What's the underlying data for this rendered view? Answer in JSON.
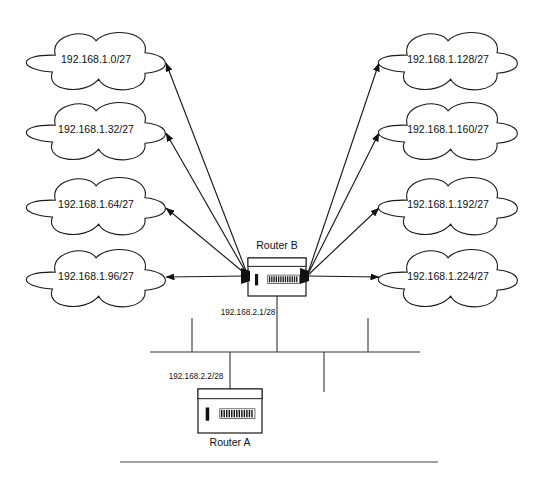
{
  "diagram": {
    "colors": {
      "stroke": "#1a1a1a",
      "line": "#333333",
      "text": "#111111",
      "background": "#ffffff"
    },
    "left_clouds": [
      {
        "label": "192.168.1.0/27",
        "cx": 96,
        "cy": 60,
        "rx": 68,
        "ry": 30,
        "arrow_x": 166,
        "arrow_y": 63
      },
      {
        "label": "192.168.1.32/27",
        "cx": 96,
        "cy": 130,
        "rx": 68,
        "ry": 30,
        "arrow_x": 166,
        "arrow_y": 133
      },
      {
        "label": "192.168.1.64/27",
        "cx": 96,
        "cy": 205,
        "rx": 68,
        "ry": 30,
        "arrow_x": 166,
        "arrow_y": 208
      },
      {
        "label": "192.168.1.96/27",
        "cx": 96,
        "cy": 277,
        "rx": 68,
        "ry": 30,
        "arrow_x": 166,
        "arrow_y": 277
      }
    ],
    "right_clouds": [
      {
        "label": "192.168.1.128/27",
        "cx": 448,
        "cy": 60,
        "rx": 68,
        "ry": 30,
        "arrow_x": 379,
        "arrow_y": 63
      },
      {
        "label": "192.168.1.160/27",
        "cx": 448,
        "cy": 130,
        "rx": 68,
        "ry": 30,
        "arrow_x": 379,
        "arrow_y": 133
      },
      {
        "label": "192.168.1.192/27",
        "cx": 448,
        "cy": 205,
        "rx": 68,
        "ry": 30,
        "arrow_x": 379,
        "arrow_y": 208
      },
      {
        "label": "192.168.1.224/27",
        "cx": 448,
        "cy": 277,
        "rx": 68,
        "ry": 30,
        "arrow_x": 379,
        "arrow_y": 277
      }
    ],
    "router_b": {
      "name": "Router B",
      "interface_label": "192.168.2.1/28",
      "x": 248,
      "y": 258,
      "w": 58,
      "h": 38,
      "name_x": 277,
      "name_y": 246,
      "iface_x": 248,
      "iface_y": 313,
      "left_hub_x": 248,
      "left_hub_y": 276,
      "right_hub_x": 307,
      "right_hub_y": 276
    },
    "router_a": {
      "name": "Router A",
      "interface_label": "192.168.2.2/28",
      "x": 198,
      "y": 389,
      "w": 64,
      "h": 44,
      "name_x": 230,
      "name_y": 443,
      "iface_x": 196,
      "iface_y": 377
    },
    "bus": {
      "y": 352,
      "x_start": 150,
      "x_end": 420,
      "drops_up": [
        {
          "x": 192,
          "y_top": 318
        },
        {
          "x": 368,
          "y_top": 318
        }
      ],
      "drops_down": [
        {
          "x": 324,
          "y_bottom": 392
        }
      ],
      "router_b_drop_x": 277,
      "router_a_drop_x": 230
    },
    "footer_rule": {
      "x1": 120,
      "x2": 438,
      "y": 462
    }
  }
}
